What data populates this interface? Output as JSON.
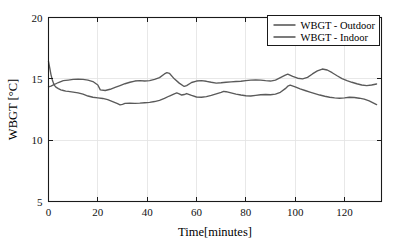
{
  "chart_data": {
    "type": "line",
    "title": "",
    "xlabel": "Time[minutes]",
    "ylabel": "WBGT [°C]",
    "xlim": [
      0,
      135
    ],
    "ylim": [
      5,
      20
    ],
    "xticks": [
      0,
      20,
      40,
      60,
      80,
      100,
      120
    ],
    "xticklabels": [
      "0",
      "20",
      "40",
      "60",
      "80",
      "100",
      "120"
    ],
    "yticks": [
      5,
      10,
      15,
      20
    ],
    "yticklabels": [
      "5",
      "10",
      "15",
      "20"
    ],
    "grid": true,
    "legend_position": "top-right",
    "series": [
      {
        "name": "WBGT - Outdoor",
        "color": "#5a5a5a",
        "x": [
          0,
          1,
          2,
          3,
          4,
          5,
          6,
          8,
          10,
          12,
          14,
          16,
          18,
          20,
          21,
          23,
          25,
          27,
          29,
          31,
          33,
          35,
          37,
          39,
          41,
          43,
          45,
          47,
          48,
          49,
          51,
          53,
          55,
          56,
          58,
          60,
          62,
          64,
          66,
          68,
          70,
          72,
          74,
          76,
          78,
          80,
          82,
          84,
          86,
          88,
          90,
          92,
          94,
          96,
          97,
          99,
          101,
          103,
          105,
          107,
          109,
          111,
          113,
          115,
          117,
          119,
          121,
          123,
          125,
          127,
          129,
          131,
          133
        ],
        "y": [
          14.35,
          14.4,
          14.5,
          14.6,
          14.7,
          14.78,
          14.85,
          14.9,
          14.95,
          14.97,
          14.95,
          14.9,
          14.78,
          14.5,
          14.1,
          14.05,
          14.15,
          14.3,
          14.45,
          14.6,
          14.72,
          14.82,
          14.85,
          14.82,
          14.85,
          14.95,
          15.1,
          15.4,
          15.5,
          15.45,
          15.0,
          14.65,
          14.38,
          14.45,
          14.7,
          14.82,
          14.85,
          14.8,
          14.72,
          14.65,
          14.68,
          14.72,
          14.75,
          14.78,
          14.8,
          14.85,
          14.9,
          14.92,
          14.9,
          14.85,
          14.82,
          14.9,
          15.1,
          15.3,
          15.38,
          15.2,
          15.05,
          15.0,
          15.12,
          15.4,
          15.65,
          15.8,
          15.72,
          15.5,
          15.25,
          15.02,
          14.85,
          14.72,
          14.6,
          14.5,
          14.45,
          14.5,
          14.58
        ]
      },
      {
        "name": "WBGT - Indoor",
        "color": "#5a5a5a",
        "x": [
          0,
          0.5,
          1,
          1.5,
          2,
          2.5,
          3,
          4,
          5,
          6,
          7,
          8,
          10,
          12,
          14,
          16,
          18,
          20,
          22,
          24,
          26,
          28,
          29,
          30,
          31,
          33,
          35,
          37,
          39,
          41,
          43,
          45,
          47,
          49,
          51,
          52,
          53,
          54,
          55,
          56,
          58,
          60,
          62,
          64,
          66,
          68,
          70,
          71,
          72,
          74,
          76,
          78,
          80,
          82,
          84,
          86,
          88,
          90,
          92,
          94,
          96,
          97,
          98,
          100,
          102,
          104,
          106,
          108,
          110,
          112,
          114,
          116,
          118,
          120,
          122,
          124,
          126,
          128,
          130,
          132,
          133
        ],
        "y": [
          16.42,
          15.9,
          15.35,
          14.95,
          14.65,
          14.45,
          14.32,
          14.2,
          14.1,
          14.05,
          14.0,
          13.98,
          13.92,
          13.85,
          13.75,
          13.6,
          13.5,
          13.45,
          13.4,
          13.3,
          13.15,
          12.98,
          12.88,
          12.92,
          13.0,
          13.02,
          13.0,
          13.02,
          13.05,
          13.08,
          13.15,
          13.25,
          13.4,
          13.6,
          13.78,
          13.85,
          13.78,
          13.68,
          13.72,
          13.8,
          13.65,
          13.52,
          13.5,
          13.55,
          13.65,
          13.78,
          13.9,
          13.98,
          13.95,
          13.85,
          13.75,
          13.68,
          13.62,
          13.6,
          13.65,
          13.7,
          13.72,
          13.7,
          13.75,
          13.9,
          14.2,
          14.4,
          14.48,
          14.35,
          14.18,
          14.05,
          13.92,
          13.8,
          13.68,
          13.58,
          13.5,
          13.45,
          13.42,
          13.45,
          13.5,
          13.48,
          13.42,
          13.35,
          13.2,
          13.0,
          12.9
        ]
      }
    ]
  },
  "legend": {
    "items": [
      {
        "label": "WBGT - Outdoor"
      },
      {
        "label": "WBGT - Indoor"
      }
    ]
  }
}
